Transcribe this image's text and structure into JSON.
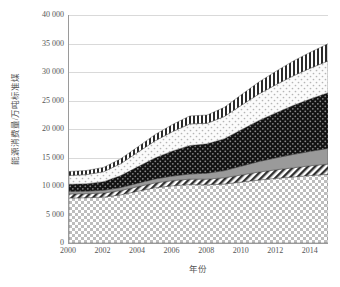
{
  "chart_data": {
    "type": "area",
    "title": "",
    "xlabel": "年份",
    "ylabel": "能源消费量/万吨标准煤",
    "xlim": [
      2000,
      2015
    ],
    "ylim": [
      0,
      40000
    ],
    "grid": true,
    "legend_position": "none",
    "x": [
      2000,
      2001,
      2002,
      2003,
      2004,
      2005,
      2006,
      2007,
      2008,
      2009,
      2010,
      2011,
      2012,
      2013,
      2014,
      2015
    ],
    "x_tick_labels": [
      "2000",
      "2002",
      "2004",
      "2006",
      "2008",
      "2010",
      "2012",
      "2014"
    ],
    "x_tick_values": [
      2000,
      2002,
      2004,
      2006,
      2008,
      2010,
      2012,
      2014
    ],
    "y_tick_labels": [
      "0",
      "5 000",
      "10 000",
      "15 000",
      "20 000",
      "25 000",
      "30 000",
      "35 000",
      "40 000"
    ],
    "y_tick_values": [
      0,
      5000,
      10000,
      15000,
      20000,
      25000,
      30000,
      35000,
      40000
    ],
    "stacked": true,
    "series": [
      {
        "name": "layer-1",
        "pattern": "checkerboard-light",
        "color": "#c9c9c9",
        "values": [
          7900,
          7950,
          8050,
          8450,
          9100,
          9700,
          10050,
          10250,
          10200,
          10350,
          10700,
          11050,
          11350,
          11600,
          11850,
          12050
        ]
      },
      {
        "name": "layer-2",
        "pattern": "diagonal-stripe",
        "color": "#8c8c8c",
        "values": [
          700,
          700,
          720,
          760,
          800,
          850,
          900,
          950,
          1000,
          1100,
          1250,
          1400,
          1500,
          1600,
          1700,
          1800
        ]
      },
      {
        "name": "layer-3",
        "pattern": "solid-gray",
        "color": "#9f9f9f",
        "values": [
          450,
          450,
          480,
          520,
          600,
          700,
          800,
          900,
          1050,
          1250,
          1550,
          1850,
          2100,
          2350,
          2550,
          2750
        ]
      },
      {
        "name": "layer-4",
        "pattern": "dotted-dark",
        "color": "#141414",
        "values": [
          1250,
          1300,
          1500,
          2100,
          2900,
          3700,
          4400,
          5000,
          5150,
          5600,
          6400,
          7200,
          7900,
          8600,
          9200,
          9750
        ]
      },
      {
        "name": "layer-5",
        "pattern": "dotted-light",
        "color": "#f2f2f2",
        "values": [
          1550,
          1600,
          1750,
          2100,
          2550,
          3000,
          3400,
          3800,
          3600,
          3900,
          4300,
          4650,
          4950,
          5200,
          5400,
          5600
        ]
      },
      {
        "name": "layer-6",
        "pattern": "vertical-stripe",
        "color": "#555555",
        "values": [
          700,
          720,
          760,
          850,
          950,
          1100,
          1250,
          1400,
          1450,
          1600,
          1850,
          2100,
          2350,
          2600,
          2800,
          3000
        ]
      }
    ],
    "totals": [
      12550,
      12720,
      13260,
      14780,
      16900,
      19050,
      20800,
      22300,
      22450,
      23800,
      26050,
      28250,
      30150,
      31950,
      33500,
      34950
    ]
  },
  "axis": {
    "y_title": "能源消费量/万吨标准煤",
    "x_title": "年份"
  },
  "colors": {
    "axis_line": "#9a9a9a",
    "grid_line": "#d9d9d9",
    "text": "#555555",
    "background": "#ffffff"
  }
}
